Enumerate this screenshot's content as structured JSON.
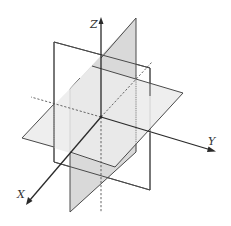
{
  "diagram": {
    "axes": {
      "x": {
        "label": "X"
      },
      "y": {
        "label": "Y"
      },
      "z": {
        "label": "Z"
      }
    },
    "planes": [
      {
        "name": "XY-plane",
        "fill": "#e9e9e9"
      },
      {
        "name": "XZ-plane",
        "fill": "none"
      },
      {
        "name": "YZ-plane",
        "fill": "#d9d9d9"
      }
    ],
    "colors": {
      "line": "#4a4a4a",
      "axis": "#2a2a2a",
      "light_fill": "#e9e9e9",
      "dark_fill": "#d9d9d9"
    }
  }
}
